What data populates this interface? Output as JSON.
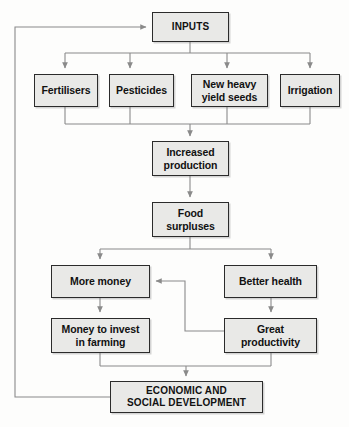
{
  "diagram": {
    "style": {
      "box_fill": "#e9e9e7",
      "box_border": "#2b2b2b",
      "connector": "#8a8a8a",
      "background": "#fdfdfc",
      "text": "#111111"
    },
    "nodes": [
      {
        "id": "inputs",
        "label": "INPUTS",
        "x": 152,
        "y": 12,
        "w": 77,
        "h": 30,
        "caps": true
      },
      {
        "id": "fertilisers",
        "label": "Fertilisers",
        "x": 34,
        "y": 74,
        "w": 64,
        "h": 33,
        "caps": false
      },
      {
        "id": "pesticides",
        "label": "Pesticides",
        "x": 109,
        "y": 74,
        "w": 65,
        "h": 33,
        "caps": false
      },
      {
        "id": "seeds",
        "label": "New heavy\nyield seeds",
        "x": 191,
        "y": 74,
        "w": 77,
        "h": 33,
        "caps": false
      },
      {
        "id": "irrigation",
        "label": "Irrigation",
        "x": 280,
        "y": 74,
        "w": 60,
        "h": 33,
        "caps": false
      },
      {
        "id": "production",
        "label": "Increased\nproduction",
        "x": 152,
        "y": 141,
        "w": 77,
        "h": 35,
        "caps": false
      },
      {
        "id": "surpluses",
        "label": "Food\nsurpluses",
        "x": 152,
        "y": 202,
        "w": 77,
        "h": 35,
        "caps": false
      },
      {
        "id": "more-money",
        "label": "More money",
        "x": 51,
        "y": 265,
        "w": 99,
        "h": 33,
        "caps": false
      },
      {
        "id": "better-health",
        "label": "Better health",
        "x": 224,
        "y": 265,
        "w": 93,
        "h": 33,
        "caps": false
      },
      {
        "id": "invest",
        "label": "Money to invest\nin farming",
        "x": 51,
        "y": 318,
        "w": 99,
        "h": 35,
        "caps": false
      },
      {
        "id": "productivity",
        "label": "Great\nproductivity",
        "x": 224,
        "y": 318,
        "w": 93,
        "h": 35,
        "caps": false
      },
      {
        "id": "development",
        "label": "ECONOMIC AND\nSOCIAL DEVELOPMENT",
        "x": 110,
        "y": 381,
        "w": 153,
        "h": 32,
        "caps": true
      }
    ],
    "edges": [
      {
        "from": "development",
        "to": "inputs",
        "kind": "feedback-left-loop"
      },
      {
        "from": "inputs",
        "to": "fertilisers",
        "kind": "fan-out"
      },
      {
        "from": "inputs",
        "to": "pesticides",
        "kind": "fan-out"
      },
      {
        "from": "inputs",
        "to": "seeds",
        "kind": "fan-out"
      },
      {
        "from": "inputs",
        "to": "irrigation",
        "kind": "fan-out"
      },
      {
        "from": "fertilisers",
        "to": "production",
        "kind": "fan-in"
      },
      {
        "from": "pesticides",
        "to": "production",
        "kind": "fan-in"
      },
      {
        "from": "seeds",
        "to": "production",
        "kind": "fan-in"
      },
      {
        "from": "irrigation",
        "to": "production",
        "kind": "fan-in"
      },
      {
        "from": "production",
        "to": "surpluses",
        "kind": "straight"
      },
      {
        "from": "surpluses",
        "to": "more-money",
        "kind": "fan-out"
      },
      {
        "from": "surpluses",
        "to": "better-health",
        "kind": "fan-out"
      },
      {
        "from": "more-money",
        "to": "invest",
        "kind": "straight"
      },
      {
        "from": "better-health",
        "to": "productivity",
        "kind": "straight"
      },
      {
        "from": "productivity",
        "to": "more-money",
        "kind": "feedback-arrow-left"
      },
      {
        "from": "invest",
        "to": "development",
        "kind": "fan-in"
      },
      {
        "from": "productivity",
        "to": "development",
        "kind": "fan-in"
      }
    ]
  }
}
